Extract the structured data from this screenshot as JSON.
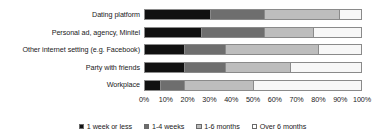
{
  "chart_data": {
    "type": "bar",
    "orientation": "horizontal",
    "stacked": true,
    "normalized_percent": true,
    "title": "",
    "subtitle": "",
    "xlabel": "",
    "ylabel": "",
    "xlim": [
      0,
      100
    ],
    "grid": false,
    "legend_position": "bottom",
    "categories": [
      "Dating platform",
      "Personal ad, agency, Minitel",
      "Other internet setting (e.g. Facebook)",
      "Party with friends",
      "Workplace"
    ],
    "tick_labels": [
      "0%",
      "10%",
      "20%",
      "30%",
      "40%",
      "50%",
      "60%",
      "70%",
      "80%",
      "90%",
      "100%"
    ],
    "tick_values": [
      0,
      10,
      20,
      30,
      40,
      50,
      60,
      70,
      80,
      90,
      100
    ],
    "series": [
      {
        "name": "1 week or less",
        "color": "#111111",
        "values": [
          30,
          26,
          18,
          18,
          7
        ]
      },
      {
        "name": "1-4 weeks",
        "color": "#6e6e6e",
        "values": [
          25,
          29,
          19,
          19,
          11
        ]
      },
      {
        "name": "1-6 months",
        "color": "#bdbdbd",
        "values": [
          35,
          23,
          43,
          30,
          32
        ]
      },
      {
        "name": "Over 6 months",
        "color": "#f7f7f7",
        "values": [
          10,
          22,
          20,
          33,
          50
        ]
      }
    ]
  },
  "legend": {
    "items": [
      {
        "label": "1 week or less"
      },
      {
        "label": "1-4 weeks"
      },
      {
        "label": "1-6 months"
      },
      {
        "label": "Over 6 months"
      }
    ]
  }
}
